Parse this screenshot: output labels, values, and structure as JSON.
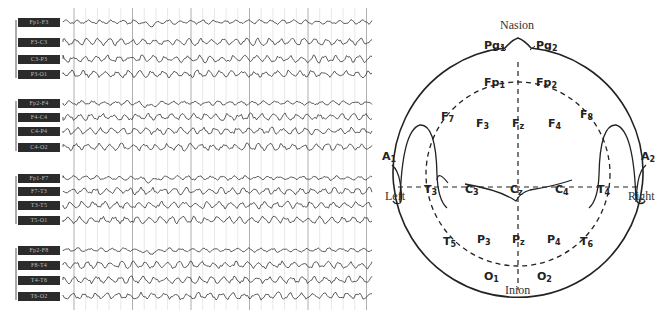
{
  "eeg": {
    "montage": "bipolar double banana",
    "groups": [
      {
        "name": "left-parasagittal",
        "channels": [
          "Fp1-F3",
          "F3-C3",
          "C3-P3",
          "P3-O1"
        ]
      },
      {
        "name": "right-parasagittal",
        "channels": [
          "Fp2-F4",
          "F4-C4",
          "C4-P4",
          "C4-O2"
        ]
      },
      {
        "name": "left-temporal",
        "channels": [
          "Fp1-F7",
          "F7-T3",
          "T3-T5",
          "T5-O1"
        ]
      },
      {
        "name": "right-temporal",
        "channels": [
          "Fp2-F8",
          "F8-T4",
          "T4-T6",
          "T6-O2"
        ]
      }
    ],
    "channel_y": [
      22,
      42,
      59,
      74,
      103,
      117,
      131,
      147,
      178,
      191,
      205,
      220,
      250,
      265,
      280,
      296
    ]
  },
  "head": {
    "landmarks": {
      "top": "Nasion",
      "bottom": "Inion",
      "left": "Left",
      "right": "Right"
    },
    "electrodes": [
      {
        "id": "Pg1",
        "base": "Pg",
        "sub": "1"
      },
      {
        "id": "Pg2",
        "base": "Pg",
        "sub": "2"
      },
      {
        "id": "Fp1",
        "base": "Fp",
        "sub": "1"
      },
      {
        "id": "Fp2",
        "base": "Fp",
        "sub": "2"
      },
      {
        "id": "F7",
        "base": "F",
        "sub": "7"
      },
      {
        "id": "F3",
        "base": "F",
        "sub": "3"
      },
      {
        "id": "Fz",
        "base": "F",
        "sub": "z"
      },
      {
        "id": "F4",
        "base": "F",
        "sub": "4"
      },
      {
        "id": "F8",
        "base": "F",
        "sub": "8"
      },
      {
        "id": "A1",
        "base": "A",
        "sub": "1"
      },
      {
        "id": "T3",
        "base": "T",
        "sub": "3"
      },
      {
        "id": "C3",
        "base": "C",
        "sub": "3"
      },
      {
        "id": "Cz",
        "base": "C",
        "sub": "z"
      },
      {
        "id": "C4",
        "base": "C",
        "sub": "4"
      },
      {
        "id": "T4",
        "base": "T",
        "sub": "4"
      },
      {
        "id": "A2",
        "base": "A",
        "sub": "2"
      },
      {
        "id": "T5",
        "base": "T",
        "sub": "5"
      },
      {
        "id": "P3",
        "base": "P",
        "sub": "3"
      },
      {
        "id": "Pz",
        "base": "P",
        "sub": "z"
      },
      {
        "id": "P4",
        "base": "P",
        "sub": "4"
      },
      {
        "id": "T6",
        "base": "T",
        "sub": "6"
      },
      {
        "id": "O1",
        "base": "O",
        "sub": "1"
      },
      {
        "id": "O2",
        "base": "O",
        "sub": "2"
      }
    ]
  }
}
